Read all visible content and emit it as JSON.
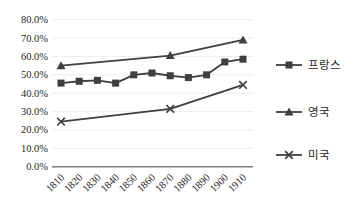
{
  "chart_data": {
    "type": "line",
    "title": "",
    "xlabel": "",
    "ylabel": "",
    "xlim": [
      1810,
      1910
    ],
    "ylim": [
      0,
      80
    ],
    "grid": true,
    "legend_position": "right",
    "x_ticks": [
      1810,
      1820,
      1830,
      1840,
      1850,
      1860,
      1870,
      1880,
      1890,
      1900,
      1910
    ],
    "y_ticks": [
      "0.0%",
      "10.0%",
      "20.0%",
      "30.0%",
      "40.0%",
      "50.0%",
      "60.0%",
      "70.0%",
      "80.0%"
    ],
    "series": [
      {
        "name": "프랑스",
        "marker": "square",
        "color": "#3f3f3f",
        "x": [
          1810,
          1820,
          1830,
          1840,
          1850,
          1860,
          1870,
          1880,
          1890,
          1900,
          1910
        ],
        "values": [
          45.5,
          46.5,
          47.0,
          45.5,
          50.0,
          51.0,
          49.5,
          48.5,
          50.0,
          57.0,
          58.5
        ]
      },
      {
        "name": "영국",
        "marker": "triangle",
        "color": "#3f3f3f",
        "x": [
          1810,
          1870,
          1910
        ],
        "values": [
          55.0,
          60.5,
          69.0
        ]
      },
      {
        "name": "미국",
        "marker": "x",
        "color": "#3f3f3f",
        "x": [
          1810,
          1870,
          1910
        ],
        "values": [
          24.5,
          31.5,
          44.5
        ]
      }
    ]
  },
  "colors": {
    "background": "#ffffff",
    "gridline": "#ececec",
    "axis_line": "#7f7f7f",
    "tick_text": "#262626",
    "series": "#3f3f3f"
  }
}
